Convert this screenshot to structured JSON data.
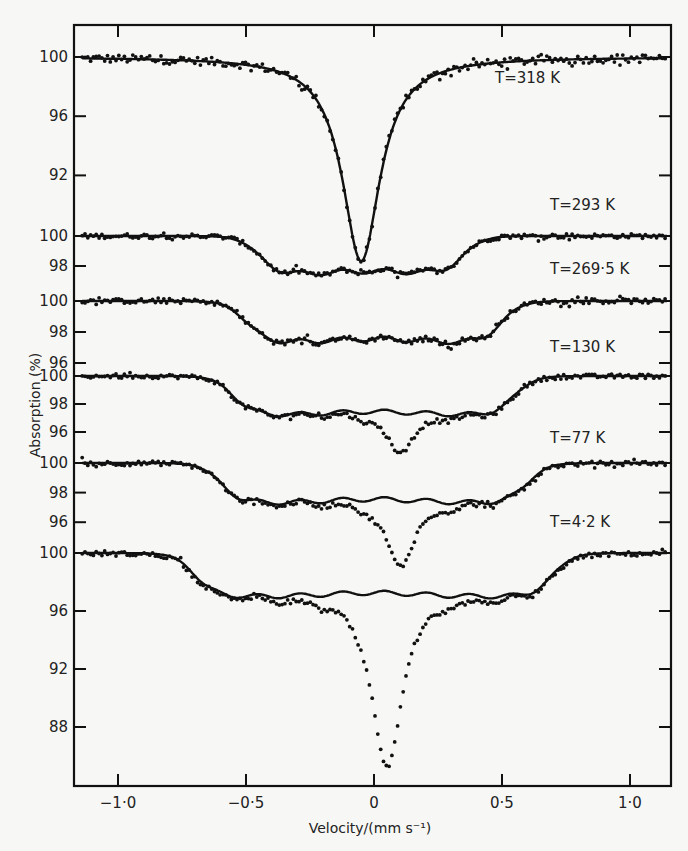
{
  "chart_data": {
    "type": "line",
    "title": "",
    "xlabel": "Velocity/(mm s⁻¹)",
    "ylabel": "Absorption (%)",
    "xlim": [
      -1.15,
      1.15
    ],
    "x_ticks": [
      -1.0,
      -0.5,
      0,
      0.5,
      1.0
    ],
    "x_tick_labels": [
      "−1·0",
      "−0·5",
      "0",
      "0·5",
      "1·0"
    ],
    "grid": false,
    "legend": "none",
    "annotations": [
      "T = 318 K",
      "T = 293 K",
      "T = 269·5 K",
      "T = 130 K",
      "T = 77 K",
      "T = 4·2 K"
    ],
    "series": [
      {
        "name": "T = 318 K",
        "label": "T=318 K",
        "y_ticks": [
          100,
          96,
          92
        ],
        "fit": {
          "baseline": 100,
          "shape": "single_line",
          "center": -0.05,
          "min": 86.2,
          "halfwidth": 0.09
        },
        "x": [
          -1.0,
          -0.6,
          -0.4,
          -0.3,
          -0.2,
          -0.15,
          -0.1,
          -0.07,
          -0.05,
          -0.03,
          0.0,
          0.05,
          0.1,
          0.2,
          0.3,
          0.4,
          0.6,
          1.0
        ],
        "values": [
          100.0,
          99.9,
          99.7,
          99.3,
          98.4,
          96.8,
          93.5,
          90.0,
          86.3,
          89.5,
          93.0,
          96.2,
          97.5,
          98.8,
          99.4,
          99.7,
          99.9,
          100.0
        ]
      },
      {
        "name": "T = 293 K",
        "label": "T=293 K",
        "y_ticks": [
          100,
          98
        ],
        "fit": {
          "baseline": 100,
          "shape": "broad_hyperfine",
          "left_edge": -0.45,
          "right_edge": 0.35,
          "depth": 2.6
        },
        "x": [
          -1.0,
          -0.6,
          -0.45,
          -0.35,
          -0.2,
          0.0,
          0.15,
          0.3,
          0.35,
          0.45,
          0.6,
          1.0
        ],
        "values": [
          100.0,
          99.7,
          99.0,
          97.8,
          97.4,
          97.3,
          97.3,
          97.7,
          98.5,
          99.4,
          99.9,
          100.0
        ]
      },
      {
        "name": "T = 269.5 K",
        "label": "T=269·5 K",
        "y_ticks": [
          100,
          98,
          96
        ],
        "fit": {
          "baseline": 100,
          "shape": "broad_hyperfine",
          "left_edge": -0.5,
          "right_edge": 0.5,
          "depth": 2.7
        },
        "x": [
          -1.0,
          -0.6,
          -0.45,
          -0.3,
          -0.1,
          0.0,
          0.1,
          0.3,
          0.45,
          0.55,
          0.7,
          1.0
        ],
        "values": [
          100.0,
          99.8,
          98.8,
          97.4,
          97.5,
          97.6,
          97.5,
          97.3,
          98.2,
          99.4,
          99.9,
          100.0
        ]
      },
      {
        "name": "T = 130 K",
        "label": "T=130 K",
        "y_ticks": [
          100,
          98,
          96
        ],
        "fit": {
          "baseline": 100,
          "shape": "broad_hyperfine",
          "left_edge": -0.55,
          "right_edge": 0.55,
          "depth": 2.8
        },
        "x": [
          -1.0,
          -0.6,
          -0.5,
          -0.4,
          -0.2,
          0.0,
          0.1,
          0.2,
          0.4,
          0.5,
          0.6,
          1.0
        ],
        "values": [
          100.0,
          99.7,
          98.4,
          97.4,
          97.5,
          97.7,
          92.0,
          97.6,
          97.3,
          98.4,
          99.5,
          100.0
        ],
        "central_line": {
          "center": 0.1,
          "min": 94.5
        }
      },
      {
        "name": "T = 77 K",
        "label": "T=77 K",
        "y_ticks": [
          100,
          98,
          96
        ],
        "fit": {
          "baseline": 100,
          "shape": "broad_hyperfine",
          "left_edge": -0.6,
          "right_edge": 0.6,
          "depth": 2.7
        },
        "x": [
          -1.0,
          -0.7,
          -0.55,
          -0.4,
          -0.2,
          0.0,
          0.1,
          0.3,
          0.5,
          0.6,
          0.7,
          1.0
        ],
        "values": [
          100.0,
          99.7,
          98.2,
          97.4,
          97.5,
          97.8,
          93.0,
          97.5,
          97.4,
          98.5,
          99.6,
          100.0
        ],
        "central_line": {
          "center": 0.1,
          "min": 93.0
        }
      },
      {
        "name": "T = 4.2 K",
        "label": "T=4·2 K",
        "y_ticks": [
          100,
          96,
          92,
          88
        ],
        "fit": {
          "baseline": 100,
          "shape": "broad_hyperfine",
          "left_edge": -0.7,
          "right_edge": 0.7,
          "depth": 3.0
        },
        "x": [
          -1.0,
          -0.75,
          -0.6,
          -0.4,
          -0.2,
          0.0,
          0.05,
          0.1,
          0.2,
          0.4,
          0.6,
          0.75,
          1.0
        ],
        "values": [
          100.0,
          99.7,
          97.8,
          97.0,
          97.2,
          96.5,
          85.2,
          91.0,
          96.2,
          97.2,
          97.5,
          99.6,
          100.0
        ],
        "central_line": {
          "center": 0.05,
          "min": 85.2
        }
      }
    ]
  },
  "axes": {
    "x_label": "Velocity/(mm s⁻¹)",
    "y_label": "Absorption (%)"
  }
}
